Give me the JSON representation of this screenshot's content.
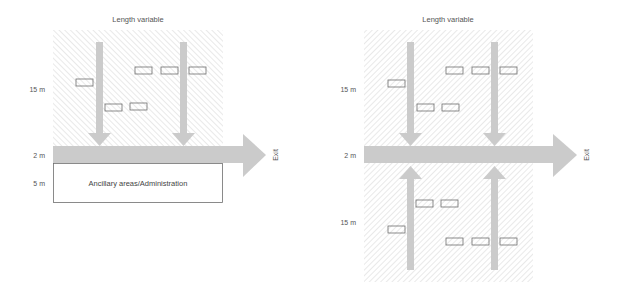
{
  "colors": {
    "arrow": "#cbcbcb",
    "hatch": "#d9d9d9",
    "box_stroke": "#6e6e6e",
    "text": "#555555"
  },
  "left_diagram": {
    "top_label": "Length variable",
    "dimension_labels": {
      "storage": "15 m",
      "aisle": "2 m",
      "ancillary": "5 m"
    },
    "exit_label": "Exit",
    "ancillary_box_label": "Ancillary areas/Administration",
    "storage_area": {
      "x": 53,
      "y": 30,
      "width": 170,
      "height": 116
    },
    "main_arrow": {
      "x1": 53,
      "y1": 146,
      "x2": 243,
      "y2": 163,
      "head_tip_x": 266
    },
    "flow_arrows": [
      {
        "x": 96,
        "top": 42,
        "head_y": 133,
        "tip_y": 146,
        "direction": "down"
      },
      {
        "x": 180,
        "top": 42,
        "head_y": 133,
        "tip_y": 146,
        "direction": "down"
      }
    ],
    "boxes": [
      {
        "x": 76,
        "y": 79
      },
      {
        "x": 135,
        "y": 67
      },
      {
        "x": 161,
        "y": 67
      },
      {
        "x": 189,
        "y": 67
      },
      {
        "x": 105,
        "y": 104
      },
      {
        "x": 130,
        "y": 103
      }
    ]
  },
  "right_diagram": {
    "top_label": "Length variable",
    "dimension_labels": {
      "upper_storage": "15 m",
      "aisle": "2 m",
      "lower_storage": "15 m"
    },
    "exit_label": "Exit",
    "upper_storage_area": {
      "x": 364,
      "y": 30,
      "width": 169,
      "height": 116
    },
    "lower_storage_area": {
      "x": 364,
      "y": 163,
      "width": 169,
      "height": 119
    },
    "main_arrow": {
      "x1": 364,
      "y1": 146,
      "x2": 553,
      "y2": 163,
      "head_tip_x": 577
    },
    "flow_arrows": [
      {
        "x": 407,
        "direction": "down"
      },
      {
        "x": 491,
        "direction": "down"
      },
      {
        "x": 407,
        "direction": "up"
      },
      {
        "x": 491,
        "direction": "up"
      }
    ],
    "upper_boxes": [
      {
        "x": 388,
        "y": 80
      },
      {
        "x": 417,
        "y": 104
      },
      {
        "x": 442,
        "y": 104
      },
      {
        "x": 446,
        "y": 67
      },
      {
        "x": 472,
        "y": 67
      },
      {
        "x": 500,
        "y": 67
      }
    ],
    "lower_boxes": [
      {
        "x": 388,
        "y": 226
      },
      {
        "x": 416,
        "y": 200
      },
      {
        "x": 441,
        "y": 200
      },
      {
        "x": 446,
        "y": 238
      },
      {
        "x": 472,
        "y": 238
      },
      {
        "x": 500,
        "y": 238
      }
    ]
  }
}
